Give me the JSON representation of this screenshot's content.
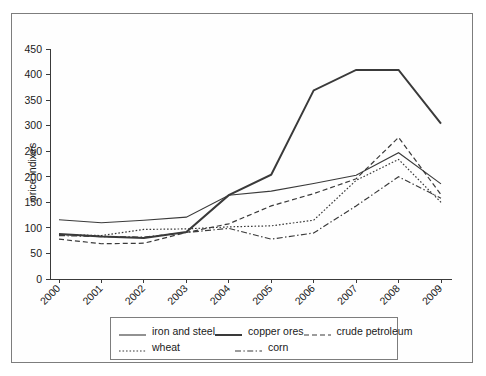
{
  "chart_data": {
    "type": "line",
    "title": "",
    "xlabel": "",
    "ylabel": "price indixes",
    "categories": [
      "2000",
      "2001",
      "2002",
      "2003",
      "2004",
      "2005",
      "2006",
      "2007",
      "2008",
      "2009"
    ],
    "ylim": [
      0,
      450
    ],
    "ytick_step": 50,
    "yticks": [
      "0",
      "50",
      "100",
      "150",
      "200",
      "250",
      "300",
      "350",
      "400",
      "450"
    ],
    "grid": false,
    "legend_position": "bottom",
    "series": [
      {
        "name": "iron and steel",
        "style": "solid-thin",
        "values": [
          116,
          110,
          115,
          121,
          164,
          172,
          187,
          203,
          247,
          186
        ]
      },
      {
        "name": "copper ores",
        "style": "solid-thick",
        "values": [
          88,
          83,
          80,
          92,
          164,
          204,
          369,
          409,
          409,
          304
        ]
      },
      {
        "name": "crude petroleum",
        "style": "dashed",
        "values": [
          78,
          69,
          70,
          91,
          108,
          143,
          167,
          196,
          277,
          165
        ]
      },
      {
        "name": "wheat",
        "style": "dotted",
        "values": [
          87,
          85,
          97,
          98,
          102,
          104,
          115,
          193,
          234,
          150
        ]
      },
      {
        "name": "corn",
        "style": "dash-dot",
        "values": [
          85,
          83,
          82,
          91,
          99,
          78,
          90,
          143,
          200,
          158
        ]
      }
    ]
  },
  "legend": {
    "rows": [
      [
        "iron and steel",
        "copper ores",
        "crude petroleum"
      ],
      [
        "wheat",
        "corn"
      ]
    ]
  },
  "colors": {
    "line": "#3a3a3a",
    "axis": "#3a3a3a",
    "frame": "#7d7d7d",
    "background": "#ffffff"
  }
}
